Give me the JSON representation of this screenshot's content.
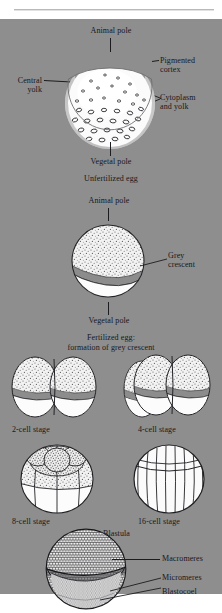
{
  "figure": {
    "background_color": "#8e8e8e",
    "text_color": "#17171c",
    "page_color": "#ffffff"
  },
  "stages": [
    {
      "id": "unfertilized-egg",
      "caption": "Unfertilized egg",
      "labels": [
        {
          "name": "animal-pole",
          "text": "Animal pole"
        },
        {
          "name": "pigmented-cortex",
          "text": "Pigmented\ncortex",
          "line1": "Pigmented",
          "line2": "cortex"
        },
        {
          "name": "central-yolk",
          "text": "Central\nyolk",
          "line1": "Central",
          "line2": "yolk"
        },
        {
          "name": "cytoplasm-and-yolk",
          "text": "Cytoplasm\nand yolk",
          "line1": "Cytoplasm",
          "line2": "and yolk"
        },
        {
          "name": "vegetal-pole",
          "text": "Vegetal pole"
        }
      ]
    },
    {
      "id": "fertilized-egg",
      "caption_line1": "Fertilized egg:",
      "caption_line2": "formation of grey crescent",
      "labels": [
        {
          "name": "animal-pole",
          "text": "Animal pole"
        },
        {
          "name": "grey-crescent",
          "line1": "Grey",
          "line2": "crescent"
        },
        {
          "name": "vegetal-pole",
          "text": "Vegetal pole"
        }
      ]
    },
    {
      "id": "two-cell",
      "caption": "2-cell stage"
    },
    {
      "id": "four-cell",
      "caption": "4-cell stage"
    },
    {
      "id": "eight-cell",
      "caption": "8-cell stage"
    },
    {
      "id": "sixteen-cell",
      "caption": "16-cell stage"
    },
    {
      "id": "blastula",
      "caption": "Blastula",
      "labels": [
        {
          "name": "macromeres",
          "text": "Macromeres"
        },
        {
          "name": "micromeres",
          "text": "Micromeres"
        },
        {
          "name": "blastocoel",
          "text": "Blastocoel"
        }
      ]
    }
  ],
  "colors": {
    "plate": "#8e8e8e",
    "cortex_halo": "#c9c9c9",
    "cytoplasm": "#fbfbfb",
    "stipple": "#6d6d6d",
    "crescent": "#8a8a8a",
    "outline": "#1f1f23"
  }
}
